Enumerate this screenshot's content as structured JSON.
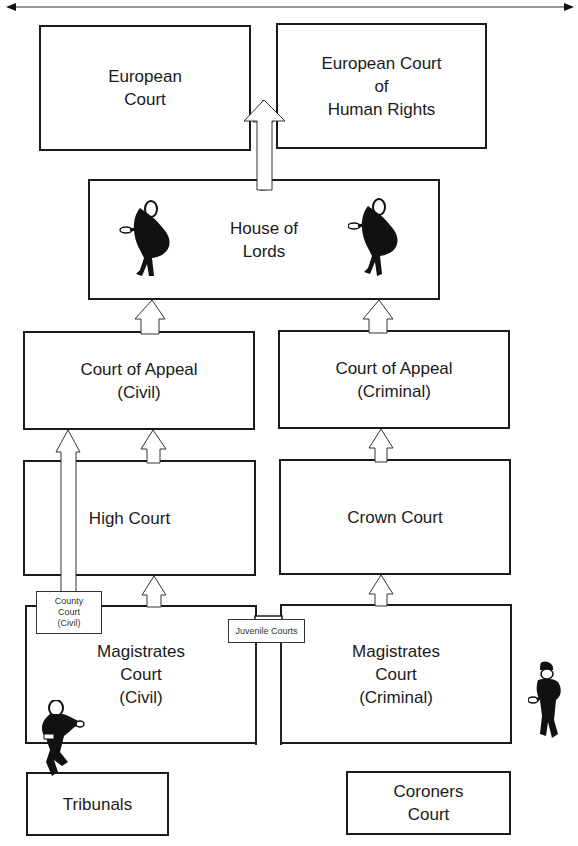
{
  "diagram": {
    "title_arrow": {
      "direction": "both",
      "label": ""
    },
    "courts": {
      "european_court": "European\nCourt",
      "echr": "European Court\nof\nHuman Rights",
      "house_of_lords": "House of\nLords",
      "appeal_civil": "Court of Appeal\n(Civil)",
      "appeal_criminal": "Court of Appeal\n(Criminal)",
      "high_court": "High Court",
      "crown_court": "Crown Court",
      "county_court": "County\nCourt\n(Civil)",
      "juvenile_courts": "Juvenile Courts",
      "magistrates_civil": "Magistrates\nCourt\n(Civil)",
      "magistrates_criminal": "Magistrates\nCourt\n(Criminal)",
      "tribunals": "Tribunals",
      "coroners_court": "Coroners\nCourt"
    },
    "arrows": [
      {
        "from": "house_of_lords",
        "to": "european_court_level"
      },
      {
        "from": "appeal_civil",
        "to": "house_of_lords"
      },
      {
        "from": "appeal_criminal",
        "to": "house_of_lords"
      },
      {
        "from": "county_court",
        "to": "appeal_civil"
      },
      {
        "from": "high_court",
        "to": "appeal_civil"
      },
      {
        "from": "crown_court",
        "to": "appeal_criminal"
      },
      {
        "from": "magistrates_civil",
        "to": "high_court"
      },
      {
        "from": "magistrates_criminal",
        "to": "crown_court"
      }
    ],
    "figures": [
      "judge-figure-left",
      "judge-figure-right",
      "barrister-figure",
      "police-officer-figure"
    ]
  }
}
